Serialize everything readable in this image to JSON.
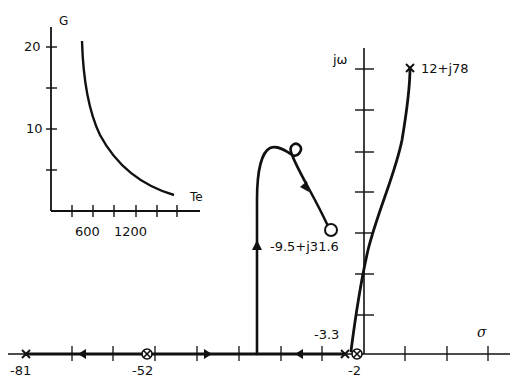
{
  "main_plot": {
    "x_axis_label": "σ",
    "y_axis_label": "jω",
    "real_axis_labels": [
      "-81",
      "-52",
      "-2"
    ],
    "points": {
      "pole_far_left": {
        "label": "-81",
        "marker": "x"
      },
      "zero_double": {
        "label": "-52",
        "marker": "⊗"
      },
      "pole_near_origin": {
        "label": "-3.3",
        "marker": "x"
      },
      "zero_near_origin": {
        "label": "-2",
        "marker": "⊗"
      },
      "complex_pole": {
        "label": "12+j78",
        "marker": "x"
      },
      "complex_zero": {
        "label": "-9.5+j31.6",
        "marker": "o"
      }
    }
  },
  "inset_plot": {
    "y_axis_label": "G",
    "x_axis_label": "Te",
    "y_tick_labels": [
      "20",
      "10"
    ],
    "x_tick_labels": [
      "600",
      "1200"
    ]
  },
  "colors": {
    "ink": "#111111",
    "background": "#ffffff"
  }
}
